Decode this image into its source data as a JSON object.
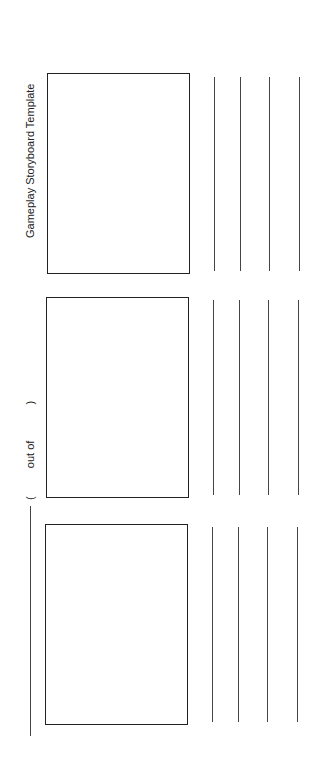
{
  "document": {
    "title": "Gameplay Storyboard Template",
    "page_indicator": {
      "open": "(",
      "middle": "out of",
      "close": ")"
    },
    "frames": [
      {
        "index": 1,
        "writing_lines": 4
      },
      {
        "index": 2,
        "writing_lines": 4
      },
      {
        "index": 3,
        "writing_lines": 4
      }
    ]
  }
}
